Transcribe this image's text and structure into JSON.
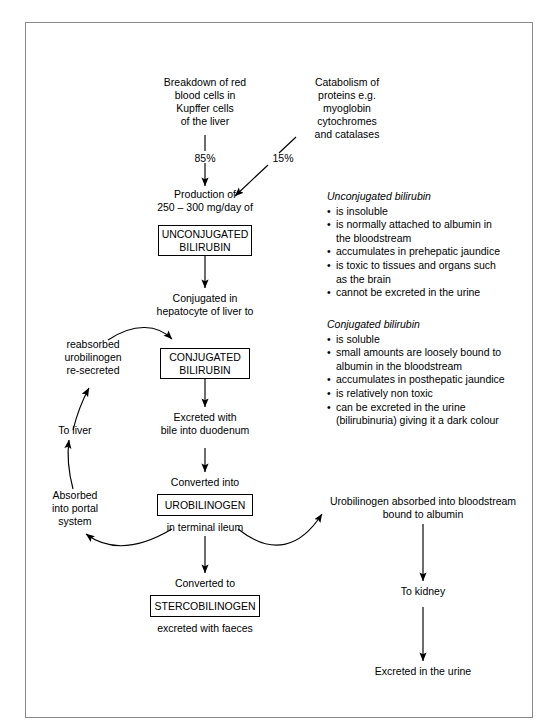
{
  "diagram": {
    "sources": {
      "rbc": "Breakdown of red\nblood cells in\nKupffer cells\nof the liver",
      "protein": "Catabolism of\nproteins e.g.\nmyoglobin\ncytochromes\nand catalases",
      "rbc_percent": "85%",
      "protein_percent": "15%"
    },
    "flow": {
      "production": "Production of\n250 – 300 mg/day of",
      "unconjugated_box": "UNCONJUGATED\nBILIRUBIN",
      "conjugation": "Conjugated in\nhepatocyte of liver to",
      "conjugated_box": "CONJUGATED\nBILIRUBIN",
      "excreted_bile": "Excreted with\nbile into duodenum",
      "converted_into": "Converted into",
      "urobilinogen_box": "UROBILINOGEN",
      "terminal_ileum": "in terminal ileum",
      "converted_to": "Converted to",
      "stercobilinogen_box": "STERCOBILINOGEN",
      "excreted_faeces": "excreted with faeces"
    },
    "enterohepatic": {
      "resecreted": "reabsorbed\nurobilinogen\nre-secreted",
      "to_liver": "To liver",
      "absorbed_portal": "Absorbed\ninto portal\nsystem"
    },
    "renal": {
      "absorbed_blood": "Urobilinogen absorbed into bloodstream\nbound to albumin",
      "to_kidney": "To kidney",
      "excreted_urine": "Excreted in the urine"
    },
    "notes": {
      "unconjugated": {
        "heading": "Unconjugated bilirubin",
        "items": [
          "is insoluble",
          "is normally attached to albumin in\nthe bloodstream",
          "accumulates in prehepatic jaundice",
          "is toxic to tissues and organs such\nas the brain",
          "cannot be excreted in the urine"
        ]
      },
      "conjugated": {
        "heading": "Conjugated bilirubin",
        "items": [
          "is soluble",
          "small amounts are loosely bound to\nalbumin in the bloodstream",
          "accumulates in posthepatic jaundice",
          "is relatively non toxic",
          "can be excreted in the urine\n(bilirubinuria) giving it a dark colour"
        ]
      }
    },
    "colors": {
      "ink": "#000000",
      "frame": "#8a8a8a",
      "background": "#ffffff"
    }
  }
}
